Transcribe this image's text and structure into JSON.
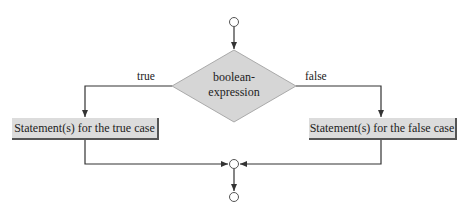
{
  "diagram": {
    "type": "flowchart",
    "decision": {
      "label_line1": "boolean-",
      "label_line2": "expression"
    },
    "branches": {
      "true": {
        "label": "true",
        "statement": "Statement(s) for the true case"
      },
      "false": {
        "label": "false",
        "statement": "Statement(s) for the false case"
      }
    },
    "colors": {
      "shape_fill": "#d6d6d6",
      "line": "#333333",
      "background": "#ffffff"
    }
  }
}
